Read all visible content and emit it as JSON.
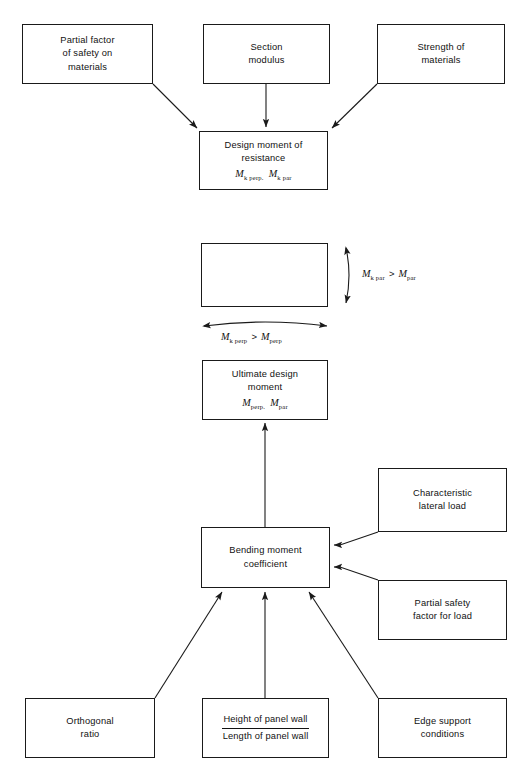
{
  "diagram": {
    "nodes": {
      "partial_factor_materials": {
        "lines": [
          "Partial factor",
          "of safety on",
          "materials"
        ]
      },
      "section_modulus": {
        "lines": [
          "Section",
          "modulus"
        ]
      },
      "strength_materials": {
        "lines": [
          "Strength of",
          "materials"
        ]
      },
      "design_moment_resistance": {
        "lines": [
          "Design moment of",
          "resistance"
        ],
        "math": {
          "sym1": "M",
          "sub1": "k perp.",
          "sym2": "M",
          "sub2": "k par"
        }
      },
      "ultimate_design_moment": {
        "lines": [
          "Ultimate design",
          "moment"
        ],
        "math": {
          "sym1": "M",
          "sub1": "perp.",
          "sym2": "M",
          "sub2": "par"
        }
      },
      "bending_moment_coefficient": {
        "lines": [
          "Bending moment",
          "coefficient"
        ]
      },
      "characteristic_lateral_load": {
        "lines": [
          "Characteristic",
          "lateral load"
        ]
      },
      "partial_safety_factor_load": {
        "lines": [
          "Partial safety",
          "factor for load"
        ]
      },
      "orthogonal_ratio": {
        "lines": [
          "Orthogonal",
          "ratio"
        ]
      },
      "panel_wall_ratio": {
        "numerator": "Height of panel wall",
        "denominator": "Length of panel wall"
      },
      "edge_support_conditions": {
        "lines": [
          "Edge support",
          "conditions"
        ]
      }
    },
    "annotations": {
      "moment_parallel": {
        "sym1": "M",
        "sub1": "k par",
        "operator": ">",
        "sym2": "M",
        "sub2": "par"
      },
      "moment_perpendicular": {
        "sym1": "M",
        "sub1": "k perp",
        "operator": ">",
        "sym2": "M",
        "sub2": "perp"
      }
    },
    "colors": {
      "stroke": "#1a1a1a",
      "text": "#111111",
      "background": "#ffffff"
    }
  }
}
